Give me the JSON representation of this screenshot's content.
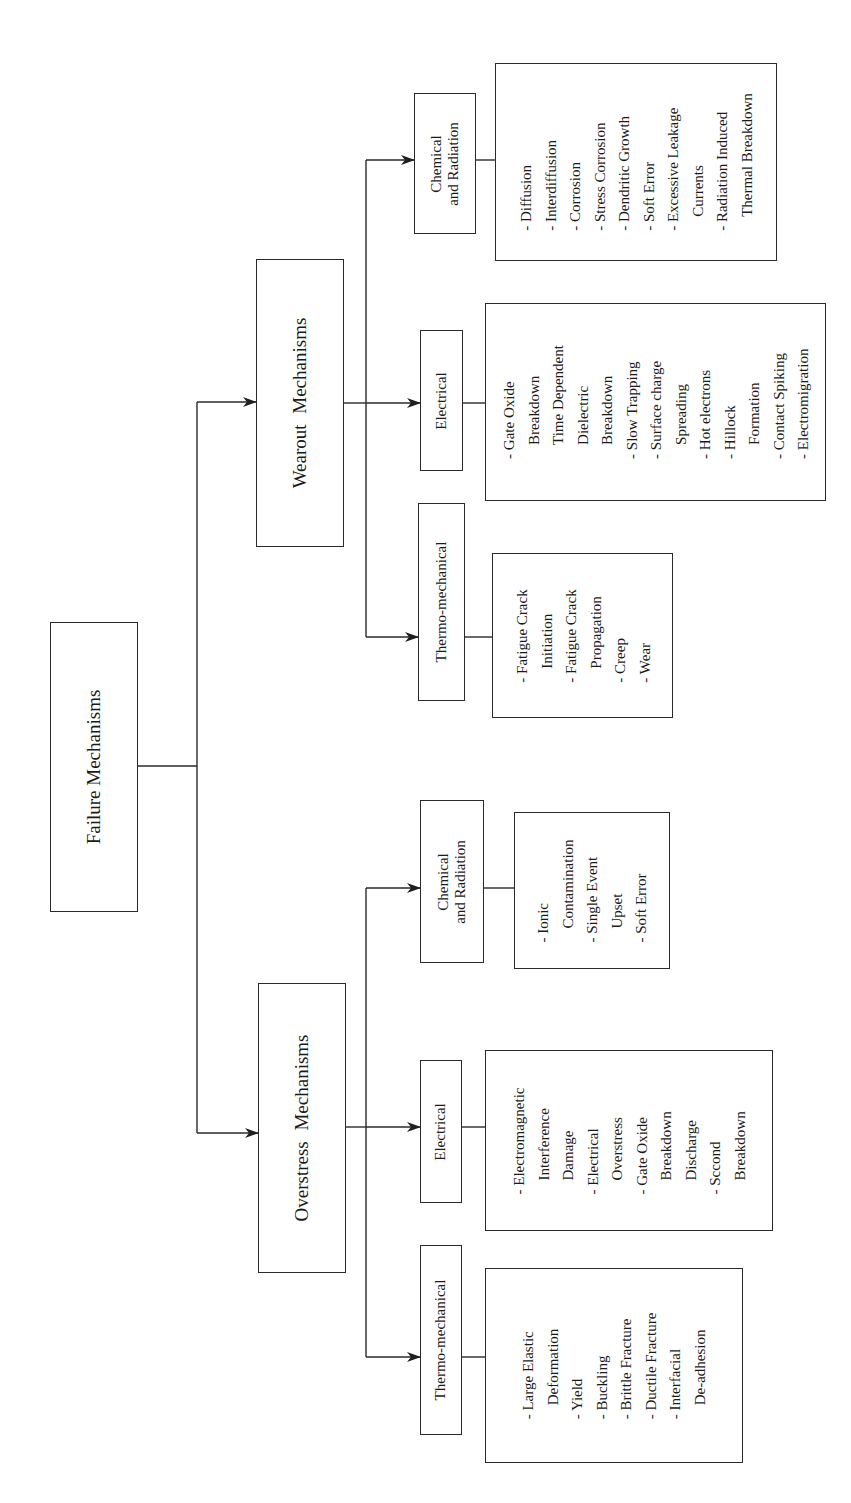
{
  "diagram": {
    "root": {
      "label": "Failure Mechanisms"
    },
    "categories": [
      {
        "label": "Overstress Mechanisms",
        "subcategories": [
          {
            "label": "Thermo-mechanical",
            "items": [
              "Large Elastic Deformation",
              "Yield",
              "Buckling",
              "Brittle Fracture",
              "Ductile Fracture",
              "Interfacial De-adhesion"
            ]
          },
          {
            "label": "Electrical",
            "items": [
              "Electromagnetic Interference Damage",
              "Electrical Overstress",
              "Gate Oxide Breakdown Discharge",
              "Sccond Breakdown"
            ]
          },
          {
            "label": "Chemical and Radiation",
            "label_lines": [
              "Chemical",
              "and Radiation"
            ],
            "items": [
              "Ionic Contamination",
              "Single Event Upset",
              "Soft Error"
            ]
          }
        ]
      },
      {
        "label": "Wearout Mechanisms",
        "subcategories": [
          {
            "label": "Thermo-mechanical",
            "items": [
              "Fatigue Crack Initiation",
              "Fatigue Crack Propagation",
              "Creep",
              "Wear"
            ]
          },
          {
            "label": "Electrical",
            "items": [
              "Gate Oxide Breakdown",
              "Time Dependent Dielectric Breakdown",
              "Slow Trapping",
              "Surface charge Spreading",
              "Hot electrons",
              "Hillock Formation",
              "Contact Spiking",
              "Electromigration"
            ]
          },
          {
            "label": "Chemical and Radiation",
            "label_lines": [
              "Chemical",
              "and Radiation"
            ],
            "items": [
              "Diffusion",
              "Interdiffusion",
              "Corrosion",
              "Stress Corrosion",
              "Dendritic Growth",
              "Soft Error",
              "Excessive Leakage Currents",
              "Radiation Induced Thermal Breakdown"
            ]
          }
        ]
      }
    ],
    "list_lines": {
      "ov_thermo": [
        {
          "t": "- Large Elastic",
          "c": false
        },
        {
          "t": "Deformation",
          "c": true
        },
        {
          "t": "- Yield",
          "c": false
        },
        {
          "t": "- Buckling",
          "c": false
        },
        {
          "t": "- Brittle Fracture",
          "c": false
        },
        {
          "t": "- Ductile Fracture",
          "c": false
        },
        {
          "t": "- Interfacial",
          "c": false
        },
        {
          "t": "De-adhesion",
          "c": true
        }
      ],
      "ov_elec": [
        {
          "t": "- Electromagnetic",
          "c": false
        },
        {
          "t": "Interference",
          "c": true
        },
        {
          "t": "Damage",
          "c": true
        },
        {
          "t": "- Electrical",
          "c": false
        },
        {
          "t": "Overstress",
          "c": true
        },
        {
          "t": "- Gate Oxide",
          "c": false
        },
        {
          "t": "Breakdown",
          "c": true
        },
        {
          "t": "Discharge",
          "c": true
        },
        {
          "t": "- Sccond",
          "c": false
        },
        {
          "t": "Breakdown",
          "c": true
        }
      ],
      "ov_chem": [
        {
          "t": "- Ionic",
          "c": false
        },
        {
          "t": "Contamination",
          "c": true
        },
        {
          "t": "- Single Event",
          "c": false
        },
        {
          "t": "Upset",
          "c": true
        },
        {
          "t": "- Soft Error",
          "c": false
        }
      ],
      "we_thermo": [
        {
          "t": "- Fatigue Crack",
          "c": false
        },
        {
          "t": "Initiation",
          "c": true
        },
        {
          "t": "- Fatigue Crack",
          "c": false
        },
        {
          "t": "Propagation",
          "c": true
        },
        {
          "t": "- Creep",
          "c": false
        },
        {
          "t": "- Wear",
          "c": false
        }
      ],
      "we_elec": [
        {
          "t": "- Gate Oxide",
          "c": false
        },
        {
          "t": "Breakdown",
          "c": true
        },
        {
          "t": "Time Dependent",
          "c": true
        },
        {
          "t": "Dielectric",
          "c": true
        },
        {
          "t": "Breakdown",
          "c": true
        },
        {
          "t": "- Slow Trapping",
          "c": false
        },
        {
          "t": "- Surface charge",
          "c": false
        },
        {
          "t": "Spreading",
          "c": true
        },
        {
          "t": "- Hot electrons",
          "c": false
        },
        {
          "t": "- Hillock",
          "c": false
        },
        {
          "t": "Formation",
          "c": true
        },
        {
          "t": "- Contact Spiking",
          "c": false
        },
        {
          "t": "- Electromigration",
          "c": false
        }
      ],
      "we_chem": [
        {
          "t": "- Diffusion",
          "c": false
        },
        {
          "t": "- Interdiffusion",
          "c": false
        },
        {
          "t": "- Corrosion",
          "c": false
        },
        {
          "t": "- Stress Corrosion",
          "c": false
        },
        {
          "t": "- Dendritic Growth",
          "c": false
        },
        {
          "t": "- Soft Error",
          "c": false
        },
        {
          "t": "- Excessive Leakage",
          "c": false
        },
        {
          "t": "Currents",
          "c": true
        },
        {
          "t": "- Radiation Induced",
          "c": false
        },
        {
          "t": "Thermal Breakdown",
          "c": true
        }
      ]
    },
    "colors": {
      "line": "#2a2a2a",
      "background": "#ffffff",
      "text": "#1a1a1a"
    }
  }
}
